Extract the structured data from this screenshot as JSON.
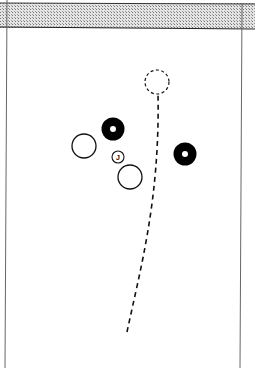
{
  "diagram": {
    "type": "lawn-bowls-head",
    "ditch": {
      "pattern": "stippled",
      "color": "#b8b8b8"
    },
    "jack": {
      "label": "J",
      "x": 118,
      "y": 157,
      "r": 6
    },
    "bowls": [
      {
        "id": "black-1",
        "color": "black",
        "x": 113,
        "y": 129,
        "r": 12
      },
      {
        "id": "black-2",
        "color": "black",
        "x": 185,
        "y": 154,
        "r": 12
      },
      {
        "id": "white-1",
        "color": "white",
        "x": 84,
        "y": 146,
        "r": 12
      },
      {
        "id": "white-2",
        "color": "white",
        "x": 130,
        "y": 177,
        "r": 12
      }
    ],
    "target_position": {
      "style": "dashed",
      "x": 157,
      "y": 82,
      "r": 12
    },
    "path": {
      "style": "dashed",
      "from": [
        127,
        332
      ],
      "to": [
        157,
        94
      ]
    }
  }
}
